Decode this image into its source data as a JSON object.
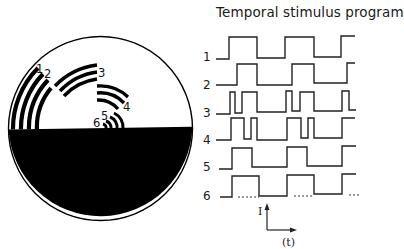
{
  "title": "Temporal stimulus program",
  "display": {
    "description": "Circular stimulus field: upper half white containing six sets of concentric arc gratings, lower half black",
    "arc_labels": [
      "1",
      "2",
      "3",
      "4",
      "5",
      "6"
    ],
    "colors": {
      "background": "#ffffff",
      "ink": "#000000"
    }
  },
  "program": {
    "rows": [
      {
        "label": "1",
        "pattern": "square wave, long period"
      },
      {
        "label": "2",
        "pattern": "square wave, long period, phase shifted"
      },
      {
        "label": "3",
        "pattern": "double pulse burst"
      },
      {
        "label": "4",
        "pattern": "double pulse burst, shifted"
      },
      {
        "label": "5",
        "pattern": "square wave"
      },
      {
        "label": "6",
        "pattern": "square wave with dashed baseline"
      }
    ],
    "axis": {
      "y_label": "I",
      "x_label": "(t)"
    }
  }
}
